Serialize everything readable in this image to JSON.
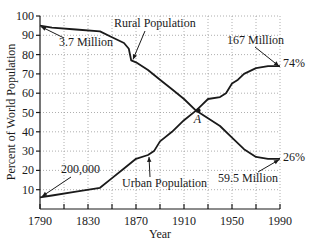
{
  "chart_data": {
    "type": "line",
    "title": "",
    "xlabel": "Year",
    "ylabel": "Percent of World Population",
    "xlim": [
      1790,
      1990
    ],
    "ylim": [
      0,
      100
    ],
    "grid": true,
    "x_ticks": [
      1790,
      1830,
      1870,
      1910,
      1950,
      1990
    ],
    "x_minor_ticks": [
      1810,
      1850,
      1890,
      1930,
      1970
    ],
    "y_ticks": [
      10,
      20,
      30,
      40,
      50,
      60,
      70,
      80,
      90,
      100
    ],
    "x_tick_labels": [
      "1790",
      "1830",
      "1870",
      "1910",
      "1950",
      "1990"
    ],
    "y_tick_labels": [
      "10",
      "20",
      "30",
      "40",
      "50",
      "60",
      "70",
      "80",
      "90",
      "100"
    ],
    "series": [
      {
        "name": "Rural Population",
        "x": [
          1790,
          1800,
          1820,
          1840,
          1850,
          1860,
          1864,
          1866,
          1870,
          1880,
          1890,
          1900,
          1910,
          1920,
          1930,
          1940,
          1950,
          1960,
          1970,
          1980,
          1990
        ],
        "values": [
          95,
          94,
          93,
          92,
          89,
          86,
          83,
          77,
          76,
          72,
          67,
          62,
          57,
          51,
          47,
          43,
          37,
          31,
          27,
          26,
          26
        ]
      },
      {
        "name": "Urban Population",
        "x": [
          1790,
          1800,
          1820,
          1840,
          1850,
          1860,
          1870,
          1880,
          1885,
          1890,
          1900,
          1910,
          1920,
          1925,
          1930,
          1940,
          1945,
          1950,
          1955,
          1960,
          1970,
          1980,
          1990
        ],
        "values": [
          6,
          7,
          9,
          11,
          16,
          21,
          26,
          28,
          30,
          35,
          40,
          46,
          51,
          54,
          57,
          58,
          60,
          65,
          67,
          70,
          73,
          74,
          74
        ]
      }
    ],
    "annotations": [
      {
        "text": "Rural Population",
        "points_to": [
          1865,
          77
        ]
      },
      {
        "text": "3.7 Million",
        "points_to": [
          1790,
          95
        ]
      },
      {
        "text": "167 Million",
        "points_to": [
          1990,
          74
        ]
      },
      {
        "text": "74%",
        "at": [
          1990,
          74
        ]
      },
      {
        "text": "200,000",
        "points_to": [
          1790,
          6
        ]
      },
      {
        "text": "Urban Population",
        "points_to": [
          1880,
          28
        ]
      },
      {
        "text": "59.5 Million",
        "points_to": [
          1990,
          26
        ]
      },
      {
        "text": "26%",
        "at": [
          1990,
          26
        ]
      },
      {
        "text": "A",
        "at": [
          1922,
          51
        ]
      }
    ],
    "legend": "none"
  }
}
